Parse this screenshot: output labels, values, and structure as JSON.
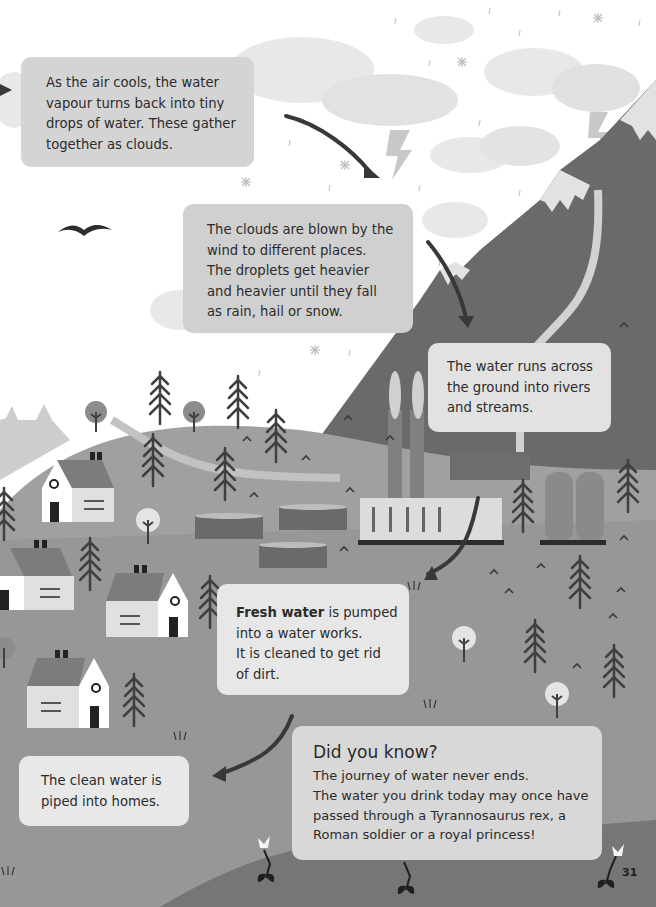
{
  "page": {
    "page_number": "31",
    "colors": {
      "sky": "#ffffff",
      "cloud": "#e6e6e6",
      "mountain_dark": "#6a6a6a",
      "hill": "#a3a3a3",
      "ground": "#9a9a9a",
      "foreground_dark": "#7a7a7a",
      "river": "#cfcfcf",
      "tree": "#3f3f3f",
      "arrow": "#3a3a3a"
    }
  },
  "captions": {
    "condensation": {
      "lines": [
        "As the air cools, the water",
        "vapour turns back into tiny",
        "drops of water. These gather",
        "together as clouds."
      ]
    },
    "precipitation": {
      "lines": [
        "The clouds are blown by the",
        "wind to different places.",
        "The droplets get heavier",
        "and heavier until they fall",
        "as rain, hail or snow."
      ]
    },
    "runoff": {
      "lines": [
        "The water runs across",
        "the ground into rivers",
        "and streams."
      ]
    },
    "water_works": {
      "bold_lead": "Fresh water",
      "line1_rest": " is pumped",
      "lines": [
        "into a water works.",
        "It is cleaned to get rid",
        "of dirt."
      ]
    },
    "homes": {
      "lines": [
        "The clean water is",
        "piped into homes."
      ]
    },
    "did_you_know": {
      "title": "Did you know?",
      "lines": [
        "The journey of water never ends.",
        "The water you drink today may once have",
        "passed through a Tyrannosaurus rex, a",
        "Roman soldier or a royal princess!"
      ]
    }
  }
}
